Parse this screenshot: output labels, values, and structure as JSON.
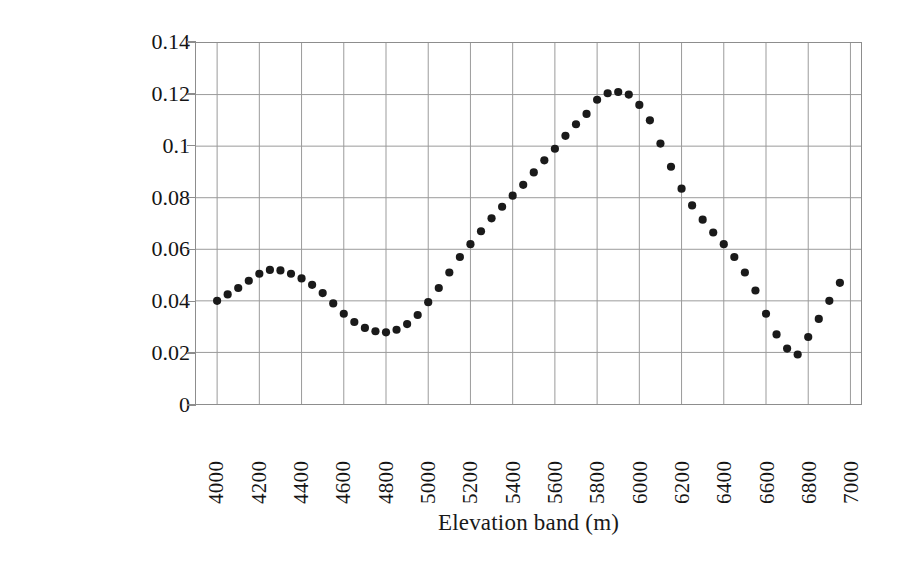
{
  "chart_data": {
    "type": "scatter",
    "title": "",
    "xlabel": "Elevation band (m)",
    "ylabel_line1": "Standard deviation of snow-cover",
    "ylabel_line2_prefix": "percentage (",
    "ylabel_line2_sigma": "σ",
    "ylabel_line2_suffix": "(S))",
    "ylabel_full": "Standard deviation of snow-cover percentage (σ(S))",
    "grid": true,
    "legend": false,
    "marker": "filled-circle",
    "marker_color": "#1a1a1a",
    "xlim": [
      3900,
      7050
    ],
    "ylim": [
      0,
      0.14
    ],
    "xticks": [
      4000,
      4200,
      4400,
      4600,
      4800,
      5000,
      5200,
      5400,
      5600,
      5800,
      6000,
      6200,
      6400,
      6600,
      6800,
      7000
    ],
    "xtick_labels": [
      "4000",
      "4200",
      "4400",
      "4600",
      "4800",
      "5000",
      "5200",
      "5400",
      "5600",
      "5800",
      "6000",
      "6200",
      "6400",
      "6600",
      "6800",
      "7000"
    ],
    "yticks": [
      0,
      0.02,
      0.04,
      0.06,
      0.08,
      0.1,
      0.12,
      0.14
    ],
    "ytick_labels": [
      "0",
      "0.02",
      "0.04",
      "0.06",
      "0.08",
      "0.1",
      "0.12",
      "0.14"
    ],
    "x": [
      4000,
      4050,
      4100,
      4150,
      4200,
      4250,
      4300,
      4350,
      4400,
      4450,
      4500,
      4550,
      4600,
      4650,
      4700,
      4750,
      4800,
      4850,
      4900,
      4950,
      5000,
      5050,
      5100,
      5150,
      5200,
      5250,
      5300,
      5350,
      5400,
      5450,
      5500,
      5550,
      5600,
      5650,
      5700,
      5750,
      5800,
      5850,
      5900,
      5950,
      6000,
      6050,
      6100,
      6150,
      6200,
      6250,
      6300,
      6350,
      6400,
      6450,
      6500,
      6550,
      6600,
      6650,
      6700,
      6750,
      6800,
      6850,
      6900,
      6950
    ],
    "y": [
      0.04,
      0.0425,
      0.045,
      0.0478,
      0.0505,
      0.052,
      0.0518,
      0.0505,
      0.0487,
      0.0462,
      0.043,
      0.039,
      0.035,
      0.0318,
      0.0295,
      0.0282,
      0.0278,
      0.0288,
      0.031,
      0.0345,
      0.0395,
      0.045,
      0.051,
      0.057,
      0.062,
      0.067,
      0.072,
      0.0765,
      0.0808,
      0.085,
      0.0898,
      0.0945,
      0.099,
      0.104,
      0.1085,
      0.1125,
      0.118,
      0.1205,
      0.121,
      0.12,
      0.116,
      0.11,
      0.101,
      0.092,
      0.0835,
      0.077,
      0.0715,
      0.0665,
      0.062,
      0.057,
      0.051,
      0.044,
      0.035,
      0.027,
      0.0215,
      0.0192,
      0.026,
      0.033,
      0.04,
      0.047
    ],
    "series": [
      {
        "name": "sigma(S) vs elevation",
        "values": [
          0.04,
          0.0425,
          0.045,
          0.0478,
          0.0505,
          0.052,
          0.0518,
          0.0505,
          0.0487,
          0.0462,
          0.043,
          0.039,
          0.035,
          0.0318,
          0.0295,
          0.0282,
          0.0278,
          0.0288,
          0.031,
          0.0345,
          0.0395,
          0.045,
          0.051,
          0.057,
          0.062,
          0.067,
          0.072,
          0.0765,
          0.0808,
          0.085,
          0.0898,
          0.0945,
          0.099,
          0.104,
          0.1085,
          0.1125,
          0.118,
          0.1205,
          0.121,
          0.12,
          0.116,
          0.11,
          0.101,
          0.092,
          0.0835,
          0.077,
          0.0715,
          0.0665,
          0.062,
          0.057,
          0.051,
          0.044,
          0.035,
          0.027,
          0.0215,
          0.0192,
          0.026,
          0.033,
          0.04,
          0.047
        ]
      }
    ],
    "annotations": {
      "local_max_low": {
        "x": 4250,
        "y": 0.052
      },
      "local_min_low": {
        "x": 4800,
        "y": 0.0278
      },
      "global_max": {
        "x": 5900,
        "y": 0.121
      },
      "global_min": {
        "x": 6750,
        "y": 0.0192
      },
      "last_point": {
        "x": 6950,
        "y": 0.047
      }
    }
  },
  "style": {
    "grid_color": "#9a9a9a",
    "axis_color": "#8d8d8d",
    "marker_color": "#1a1a1a",
    "text_color": "#141414",
    "background": "#ffffff"
  }
}
